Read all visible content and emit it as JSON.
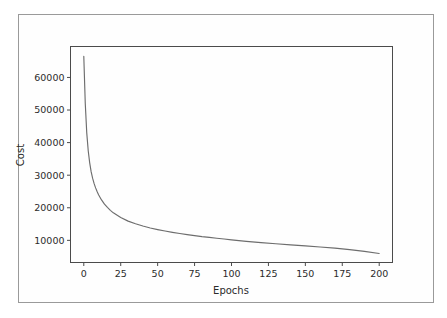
{
  "figure": {
    "background_color": "#fefefe",
    "border_color": "#9a9a9a",
    "axes_color": "#4b4b4b"
  },
  "chart_data": {
    "type": "line",
    "title": "",
    "xlabel": "Epochs",
    "ylabel": "Cost",
    "xlim": [
      -9,
      209
    ],
    "ylim": [
      3200,
      69500
    ],
    "grid": false,
    "legend": null,
    "line_color": "#6d6d6d",
    "xticks": [
      0,
      25,
      50,
      75,
      100,
      125,
      150,
      175,
      200
    ],
    "xtick_labels": [
      "0",
      "25",
      "50",
      "75",
      "100",
      "125",
      "150",
      "175",
      "200"
    ],
    "yticks": [
      10000,
      20000,
      30000,
      40000,
      50000,
      60000
    ],
    "ytick_labels": [
      "10000",
      "20000",
      "30000",
      "40000",
      "50000",
      "60000"
    ],
    "series": [
      {
        "name": "Cost",
        "x": [
          0,
          1,
          2,
          3,
          4,
          5,
          6,
          7,
          8,
          9,
          10,
          12,
          14,
          16,
          18,
          20,
          25,
          30,
          35,
          40,
          45,
          50,
          55,
          60,
          65,
          70,
          75,
          80,
          85,
          90,
          95,
          100,
          110,
          120,
          130,
          140,
          150,
          160,
          170,
          180,
          190,
          200
        ],
        "y": [
          66500,
          52000,
          43000,
          37500,
          33800,
          31000,
          29000,
          27400,
          26100,
          25000,
          24000,
          22400,
          21100,
          20100,
          19200,
          18450,
          17000,
          15900,
          15100,
          14400,
          13800,
          13300,
          12850,
          12450,
          12100,
          11750,
          11450,
          11150,
          10900,
          10650,
          10400,
          10150,
          9700,
          9300,
          8950,
          8600,
          8300,
          7950,
          7600,
          7150,
          6600,
          5950
        ]
      }
    ]
  }
}
